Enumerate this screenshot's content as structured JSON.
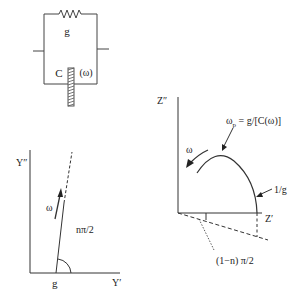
{
  "circuit": {
    "resistor_label": "g",
    "capacitor_label": "C",
    "capacitor_arg": "(ω)"
  },
  "admittance_plot": {
    "y_axis_label": "Y″",
    "x_axis_label": "Y′",
    "intercept_label": "g",
    "angle_label": "nπ/2",
    "direction_label": "ω"
  },
  "impedance_plot": {
    "y_axis_label": "Z″",
    "x_axis_label": "Z′",
    "peak_label": "ωp = g/[C(ω)]",
    "peak_label_main": "ω",
    "peak_label_sub": "p",
    "peak_label_rest": " = g/[C(ω)]",
    "intercept_label": "1/g",
    "angle_label": "(1−n) π/2",
    "direction_label": "ω"
  },
  "colors": {
    "line": "#333333",
    "background": "#ffffff"
  }
}
